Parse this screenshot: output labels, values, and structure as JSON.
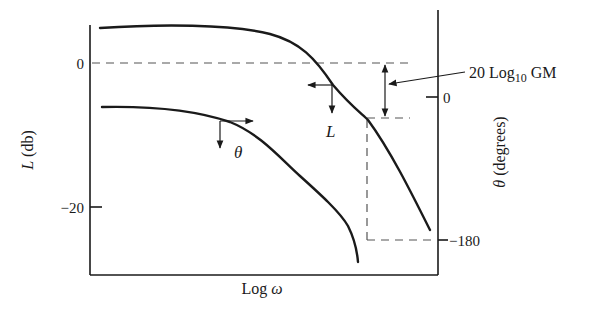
{
  "figure": {
    "type": "bode-plot-gain-margin-diagram",
    "left_axis": {
      "label_symbol": "L",
      "label_unit": "(db)",
      "ticks": [
        {
          "label": "0",
          "value": 0
        },
        {
          "label": "−20",
          "value": -20
        }
      ]
    },
    "right_axis": {
      "label_symbol": "θ",
      "label_unit": "(degrees)",
      "ticks": [
        {
          "label": "0",
          "value": 0
        },
        {
          "label": "−180",
          "value": -180
        }
      ]
    },
    "x_axis": {
      "label_prefix": "Log",
      "label_symbol": "ω"
    },
    "curves": [
      {
        "name": "magnitude",
        "label": "L",
        "description": "Log-magnitude curve (read against left axis)"
      },
      {
        "name": "phase",
        "label": "θ",
        "description": "Phase-angle curve (read against right axis)"
      }
    ],
    "annotations": {
      "gain_margin_label_prefix": "20 Log",
      "gain_margin_label_subscript": "10",
      "gain_margin_label_suffix": " GM",
      "L_curve_label": "L",
      "theta_curve_label": "θ"
    },
    "colors": {
      "ink": "#1a1a1a",
      "dash": "#555555",
      "background": "#ffffff"
    }
  }
}
